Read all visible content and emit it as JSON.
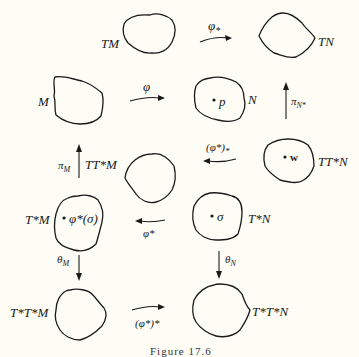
{
  "figure": {
    "caption": "Figure 17.6",
    "spaces": {
      "TM": "TM",
      "TN": "TN",
      "M": "M",
      "N": "N",
      "TTstarM": "TT*M",
      "TTstarN": "TT*N",
      "TstarM": "T*M",
      "TstarN": "T*N",
      "TstarTstarM": "T*T*M",
      "TstarTstarN": "T*T*N"
    },
    "points": {
      "p": "p",
      "w": "w",
      "sigma": "σ",
      "phi_star_sigma": "φ*(σ)"
    },
    "maps": {
      "phi_push": "φ",
      "phi_lower_star": "φ",
      "phi_lower_star_sub": "*",
      "pi_N_star": "π",
      "pi_N_star_sub": "N*",
      "pi_M": "π",
      "pi_M_sub": "M",
      "phi_star_push": "(φ*)",
      "phi_star_push_sub": "*",
      "phi_pullback": "φ*",
      "theta_M": "θ",
      "theta_M_sub": "M",
      "theta_N": "θ",
      "theta_N_sub": "N",
      "phi_star_star": "(φ*)*"
    }
  }
}
